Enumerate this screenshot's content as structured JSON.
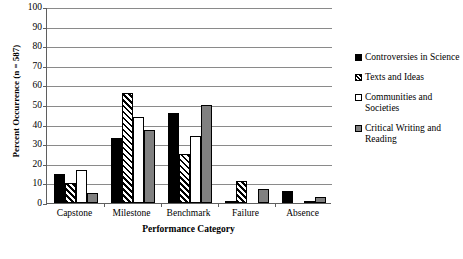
{
  "chart_data": {
    "type": "bar",
    "title": "",
    "xlabel": "Performance Category",
    "ylabel": "Percent Occurrence (n = 587)",
    "categories": [
      "Capstone",
      "Milestone",
      "Benchmark",
      "Failure",
      "Absence"
    ],
    "series": [
      {
        "name": "Controversies in Science",
        "swatch": "black-square",
        "values": [
          15,
          33,
          46,
          1,
          6
        ]
      },
      {
        "name": "Texts and Ideas",
        "swatch": "hatched-square",
        "values": [
          10,
          56,
          25,
          11,
          0
        ]
      },
      {
        "name": "Communities and Societies",
        "swatch": "white-square",
        "values": [
          17,
          44,
          34,
          0,
          1
        ]
      },
      {
        "name": "Critical Writing and Reading",
        "swatch": "gray-square",
        "values": [
          5,
          37,
          50,
          7,
          3
        ]
      }
    ],
    "ylim": [
      0,
      100
    ],
    "ytick_step": 10,
    "yticks": [
      "0",
      "10",
      "20",
      "30",
      "40",
      "50",
      "60",
      "70",
      "80",
      "90",
      "100"
    ],
    "grid": true,
    "legend_position": "right",
    "colors": {
      "series_0": "#000000",
      "series_1": "#ffffff",
      "series_2": "#ffffff",
      "series_3": "#808080",
      "outline": "#000000",
      "gridline": "#8a8a8a",
      "axis": "#5f5f5f",
      "background": "#ffffff"
    }
  }
}
